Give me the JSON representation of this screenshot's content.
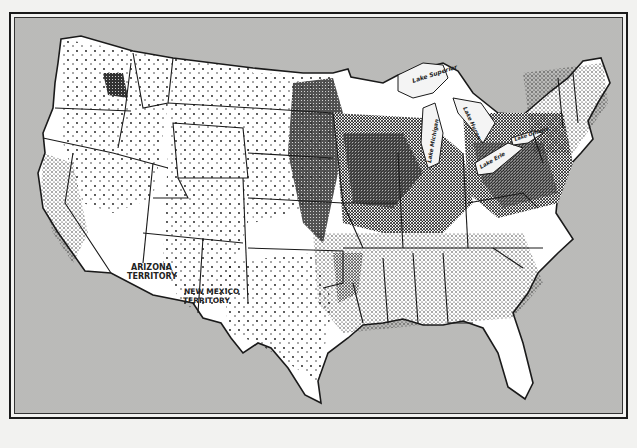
{
  "map": {
    "type": "dot-density population map",
    "region": "United States",
    "colors": {
      "water": "#c9c9c7",
      "land": "#ffffff",
      "border": "#1a1a1a",
      "dots": "#111111"
    },
    "labels": {
      "arizona": [
        "ARIZONA",
        "TERRITORY"
      ],
      "new_mexico": [
        "NEW MEXICO",
        "TERRITORY"
      ],
      "lake_superior": "Lake Superior",
      "lake_michigan": "Lake Michigan",
      "lake_huron": "Lake Huron",
      "lake_erie": "Lake Erie",
      "lake_ontario": "Lake Ontario"
    }
  }
}
